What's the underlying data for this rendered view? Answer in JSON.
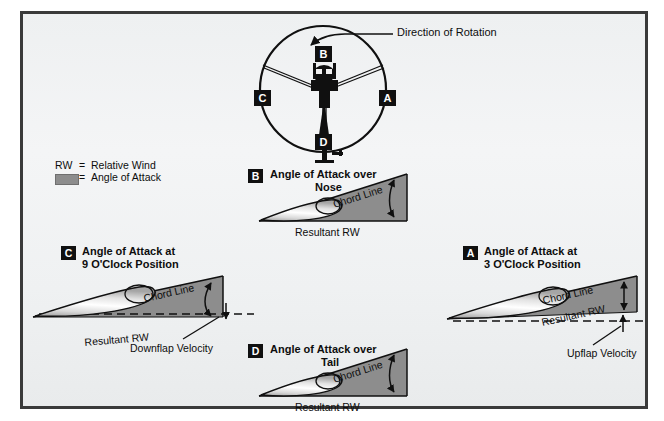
{
  "figure": {
    "title_alt": "Helicopter rotor blade angle of attack at clock positions",
    "background_color": "#eff1f2",
    "border_color": "#3a3a3a",
    "wedge_color": "#8d8d8d",
    "line_color": "#101010"
  },
  "rotor_disc": {
    "annotation": "Direction of Rotation",
    "positions": [
      {
        "id": "A",
        "label": "A",
        "location": "right"
      },
      {
        "id": "B",
        "label": "B",
        "location": "top"
      },
      {
        "id": "C",
        "label": "C",
        "location": "left"
      },
      {
        "id": "D",
        "label": "D",
        "location": "bottom"
      }
    ]
  },
  "legend": {
    "rw_abbrev": "RW",
    "rw_equals": "=",
    "rw_meaning": "Relative Wind",
    "swatch_equals": "=",
    "swatch_meaning": "Angle of Attack"
  },
  "sections": {
    "b": {
      "badge": "B",
      "title_line1": "Angle of Attack over",
      "title_line2": "Nose",
      "chord_label": "Chord Line",
      "rw_label": "Resultant RW"
    },
    "c": {
      "badge": "C",
      "title_line1": "Angle of Attack at",
      "title_line2": "9 O'Clock Position",
      "chord_label": "Chord Line",
      "rw_label": "Resultant RW",
      "velocity_label": "Downflap Velocity"
    },
    "a": {
      "badge": "A",
      "title_line1": "Angle of Attack at",
      "title_line2": "3 O'Clock Position",
      "chord_label": "Chord Line",
      "rw_label": "Resultant RW",
      "velocity_label": "Upflap Velocity"
    },
    "d": {
      "badge": "D",
      "title_line1": "Angle of Attack over",
      "title_line2": "Tail",
      "chord_label": "Chord Line",
      "rw_label": "Resultant RW"
    }
  }
}
